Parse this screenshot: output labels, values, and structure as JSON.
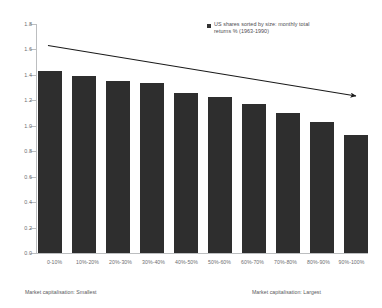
{
  "legend": {
    "marker_color": "#333333",
    "line1": "US shares sorted by size: monthly total",
    "line2": "returns % (1963-1990)"
  },
  "footnotes": {
    "left": "Market capitalisation: Smallest",
    "right": "Market capitalisation: Largest"
  },
  "annotation": {
    "type": "trend-arrow",
    "direction": "downward-right",
    "color": "#1a1a1a"
  },
  "chart_data": {
    "type": "bar",
    "title": "",
    "subtitle": "",
    "xlabel": "",
    "ylabel": "",
    "ylim": [
      0.0,
      1.8
    ],
    "ytick_labels": [
      "1.8",
      "1.6",
      "1.4",
      "1.2",
      "1.0",
      "0.8",
      "0.6",
      "0.4",
      "0.2",
      "0.0"
    ],
    "ytick_values": [
      1.8,
      1.6,
      1.4,
      1.2,
      1.0,
      0.8,
      0.6,
      0.4,
      0.2,
      0.0
    ],
    "grid": false,
    "legend_position": "top-right",
    "bar_color": "#2e2e2e",
    "categories": [
      "0-10%",
      "10%-20%",
      "20%-30%",
      "30%-40%",
      "40%-50%",
      "50%-60%",
      "60%-70%",
      "70%-80%",
      "80%-90%",
      "90%-100%"
    ],
    "values": [
      1.43,
      1.39,
      1.35,
      1.34,
      1.26,
      1.23,
      1.17,
      1.1,
      1.03,
      0.93
    ],
    "series": [
      {
        "name": "US shares sorted by size: monthly total returns % (1963-1990)",
        "values": [
          1.43,
          1.39,
          1.35,
          1.34,
          1.26,
          1.23,
          1.17,
          1.1,
          1.03,
          0.93
        ]
      }
    ]
  }
}
